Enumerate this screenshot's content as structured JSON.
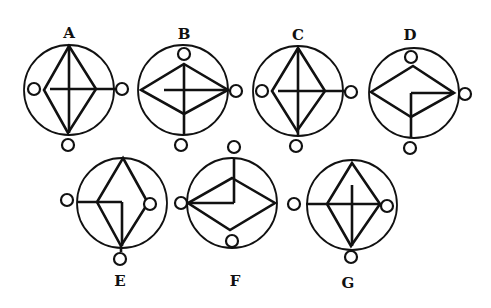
{
  "options": [
    {
      "label": "A",
      "label_pos": [
        69,
        38
      ]
    },
    {
      "label": "B",
      "label_pos": [
        184,
        39
      ]
    },
    {
      "label": "C",
      "label_pos": [
        298,
        40
      ]
    },
    {
      "label": "D",
      "label_pos": [
        410,
        40
      ]
    },
    {
      "label": "E",
      "label_pos": [
        120,
        286
      ]
    },
    {
      "label": "F",
      "label_pos": [
        235,
        286
      ]
    },
    {
      "label": "G",
      "label_pos": [
        348,
        288
      ]
    }
  ],
  "figures": [
    {
      "id": "A",
      "circle": {
        "cx": 69,
        "cy": 90,
        "r": 45
      },
      "diamond": [
        [
          69,
          46
        ],
        [
          96,
          89
        ],
        [
          68,
          133
        ],
        [
          44,
          90
        ]
      ],
      "lines": [
        [
          [
            69,
            46
          ],
          [
            69,
            133
          ]
        ],
        [
          [
            50,
            89
          ],
          [
            116,
            89
          ]
        ]
      ],
      "dots": [
        [
          34,
          89
        ],
        [
          122,
          89
        ],
        [
          68,
          145
        ]
      ]
    },
    {
      "id": "B",
      "circle": {
        "cx": 183,
        "cy": 90,
        "r": 45
      },
      "diamond": [
        [
          184,
          64
        ],
        [
          228,
          90
        ],
        [
          184,
          114
        ],
        [
          141,
          90
        ]
      ],
      "lines": [
        [
          [
            184,
            64
          ],
          [
            184,
            135
          ]
        ],
        [
          [
            164,
            90
          ],
          [
            228,
            90
          ]
        ]
      ],
      "dots": [
        [
          184,
          54
        ],
        [
          236,
          91
        ],
        [
          181,
          145
        ]
      ]
    },
    {
      "id": "C",
      "circle": {
        "cx": 298,
        "cy": 91,
        "r": 45
      },
      "diamond": [
        [
          298,
          48
        ],
        [
          325,
          91
        ],
        [
          297,
          131
        ],
        [
          272,
          91
        ]
      ],
      "lines": [
        [
          [
            298,
            48
          ],
          [
            298,
            136
          ]
        ],
        [
          [
            278,
            91
          ],
          [
            345,
            91
          ]
        ]
      ],
      "dots": [
        [
          262,
          91
        ],
        [
          351,
          92
        ],
        [
          296,
          146
        ]
      ]
    },
    {
      "id": "D",
      "circle": {
        "cx": 414,
        "cy": 93,
        "r": 45
      },
      "diamond": [
        [
          413,
          66
        ],
        [
          454,
          93
        ],
        [
          411,
          117
        ],
        [
          371,
          92
        ]
      ],
      "lines": [
        [
          [
            411,
            93
          ],
          [
            454,
            93
          ]
        ],
        [
          [
            411,
            93
          ],
          [
            411,
            137
          ]
        ]
      ],
      "dots": [
        [
          411,
          57
        ],
        [
          465,
          94
        ],
        [
          410,
          148
        ]
      ]
    },
    {
      "id": "E",
      "circle": {
        "cx": 122,
        "cy": 203,
        "r": 45
      },
      "diamond": [
        [
          123,
          158
        ],
        [
          148,
          203
        ],
        [
          121,
          246
        ],
        [
          97,
          202
        ]
      ],
      "lines": [
        [
          [
            77,
            202
          ],
          [
            122,
            202
          ]
        ],
        [
          [
            122,
            202
          ],
          [
            122,
            246
          ]
        ],
        [
          [
            121,
            246
          ],
          [
            121,
            252
          ]
        ]
      ],
      "dots": [
        [
          67,
          200
        ],
        [
          150,
          204
        ],
        [
          120,
          259
        ]
      ]
    },
    {
      "id": "F",
      "circle": {
        "cx": 232,
        "cy": 203,
        "r": 45
      },
      "diamond": [
        [
          232,
          178
        ],
        [
          275,
          203
        ],
        [
          230,
          230
        ],
        [
          188,
          203
        ]
      ],
      "lines": [
        [
          [
            234,
            158
          ],
          [
            234,
            203
          ]
        ],
        [
          [
            188,
            203
          ],
          [
            234,
            203
          ]
        ]
      ],
      "dots": [
        [
          234,
          147
        ],
        [
          181,
          203
        ],
        [
          232,
          241
        ]
      ]
    },
    {
      "id": "G",
      "circle": {
        "cx": 352,
        "cy": 205,
        "r": 45
      },
      "diamond": [
        [
          352,
          163
        ],
        [
          380,
          204
        ],
        [
          351,
          246
        ],
        [
          327,
          204
        ]
      ],
      "lines": [
        [
          [
            352,
            185
          ],
          [
            352,
            246
          ]
        ],
        [
          [
            306,
            204
          ],
          [
            380,
            204
          ]
        ]
      ],
      "dots": [
        [
          294,
          204
        ],
        [
          387,
          206
        ],
        [
          351,
          257
        ]
      ]
    }
  ],
  "dot_radius": 6
}
